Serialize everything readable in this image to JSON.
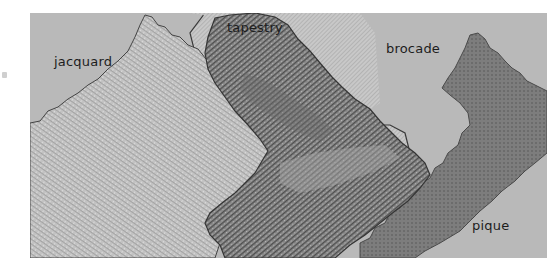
{
  "image": {
    "subject": "four woven fabric swatches with pinked edges",
    "colors": {
      "background": "#b9b9b9",
      "jacquard": "#c4c4c4",
      "tapestry": "#8a8a8a",
      "tapestry_dark": "#5e5e5e",
      "brocade": "#c6c6c6",
      "pique": "#7e7e7e",
      "edge": "#3a3a3a"
    }
  },
  "labels": {
    "jacquard": "jacquard",
    "tapestry": "tapestry",
    "brocade": "brocade",
    "pique": "pique"
  }
}
